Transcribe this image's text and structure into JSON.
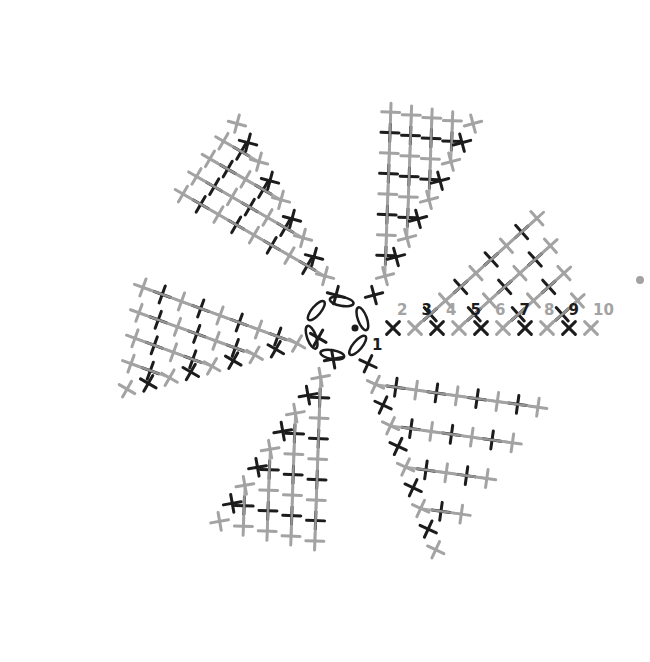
{
  "diagram": {
    "type": "crochet-chart",
    "center": {
      "x": 355,
      "y": 328
    },
    "colors": {
      "dark": "#1c1c1c",
      "light": "#a3a3a3",
      "background": "#ffffff"
    },
    "ring": {
      "chains": 6,
      "symbol": "chain-oval",
      "center_dot": true,
      "label": "1"
    },
    "row_numbers": [
      "2",
      "3",
      "4",
      "5",
      "6",
      "7",
      "8",
      "9",
      "10"
    ],
    "row_number_colors": [
      "light",
      "dark",
      "light",
      "dark",
      "light",
      "dark",
      "light",
      "dark",
      "light"
    ],
    "end_marker": "dot",
    "wedges": [
      {
        "name": "right-upper",
        "spine_angle": 0,
        "row_angle": -42,
        "rows": 9
      },
      {
        "name": "top-right",
        "spine_angle": -60,
        "row_angle": -88,
        "rows": 9
      },
      {
        "name": "top-left",
        "spine_angle": -120,
        "row_angle": -150,
        "rows": 9
      },
      {
        "name": "left",
        "spine_angle": 165,
        "row_angle": 200,
        "rows": 9
      },
      {
        "name": "bottom-left",
        "spine_angle": 125,
        "row_angle": 92,
        "rows": 9
      },
      {
        "name": "bottom-right",
        "spine_angle": 70,
        "row_angle": 8,
        "rows": 9
      }
    ],
    "stitch_legend": {
      "x_stitch": "single crochet (first of row)",
      "plus_stitch": "single crochet",
      "v_stitch": "increase"
    }
  }
}
